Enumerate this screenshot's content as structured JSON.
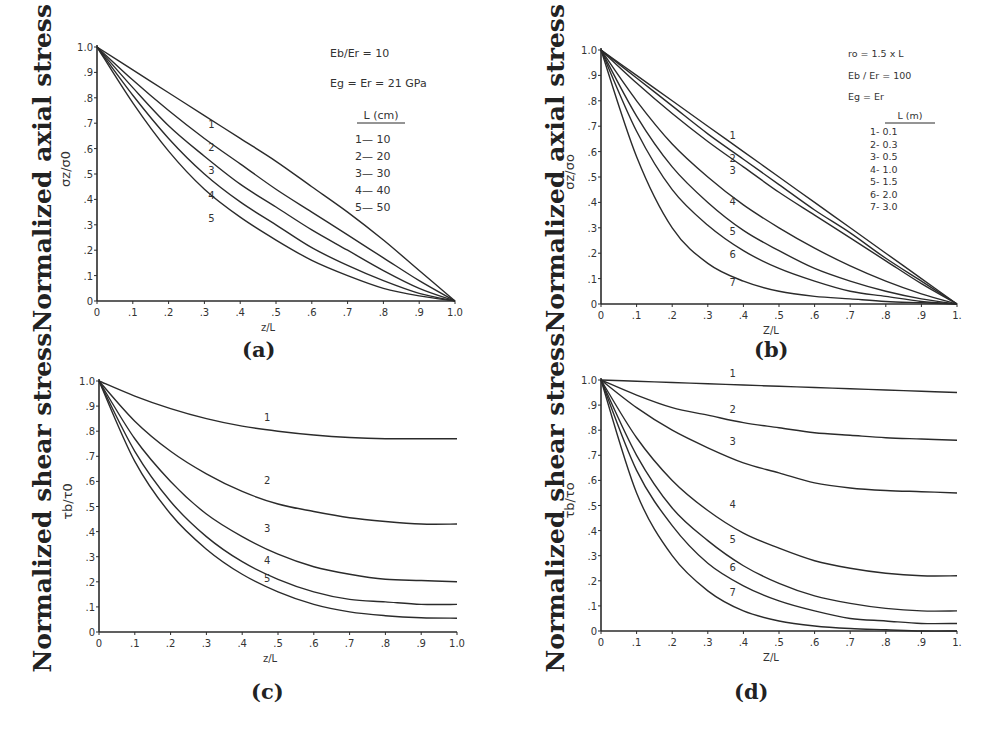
{
  "figure": {
    "panels": [
      {
        "id": "a",
        "label": "(a)",
        "big_ylabel": "Normalized axial stress"
      },
      {
        "id": "b",
        "label": "(b)",
        "big_ylabel": "Normalized axial stress"
      },
      {
        "id": "c",
        "label": "(c)",
        "big_ylabel": "Normalized shear stress"
      },
      {
        "id": "d",
        "label": "(d)",
        "big_ylabel": "Normalized shear stress"
      }
    ]
  },
  "chart_data": [
    {
      "panel": "a",
      "type": "line",
      "title": "",
      "ylabel": "σz/σ0",
      "xlabel": "z/L",
      "xlim": [
        0,
        1.0
      ],
      "ylim": [
        0,
        1.0
      ],
      "xticks": [
        "0",
        ".1",
        ".2",
        ".3",
        ".4",
        ".5",
        ".6",
        ".7",
        ".8",
        ".9",
        "1.0"
      ],
      "yticks": [
        "0",
        ".1",
        ".2",
        ".3",
        ".4",
        ".5",
        ".6",
        ".7",
        ".8",
        ".9",
        "1.0"
      ],
      "grid": false,
      "annotations": [
        "Eb/Er = 10",
        "Eg = Er = 21 GPa"
      ],
      "legend_title": "L (cm)",
      "legend": [
        "1— 10",
        "2— 20",
        "3— 30",
        "4— 40",
        "5— 50"
      ],
      "x": [
        0,
        0.1,
        0.2,
        0.3,
        0.4,
        0.5,
        0.6,
        0.7,
        0.8,
        0.9,
        1.0
      ],
      "series": [
        {
          "name": "1",
          "L": "10 cm",
          "values": [
            1,
            0.91,
            0.82,
            0.73,
            0.64,
            0.55,
            0.45,
            0.35,
            0.24,
            0.12,
            0
          ],
          "label_at": [
            0.32,
            0.68
          ]
        },
        {
          "name": "2",
          "L": "20 cm",
          "values": [
            1,
            0.87,
            0.75,
            0.64,
            0.54,
            0.44,
            0.35,
            0.26,
            0.17,
            0.08,
            0
          ],
          "label_at": [
            0.32,
            0.59
          ]
        },
        {
          "name": "3",
          "L": "30 cm",
          "values": [
            1,
            0.84,
            0.69,
            0.57,
            0.46,
            0.37,
            0.28,
            0.2,
            0.12,
            0.05,
            0
          ],
          "label_at": [
            0.32,
            0.5
          ]
        },
        {
          "name": "4",
          "L": "40 cm",
          "values": [
            1,
            0.81,
            0.64,
            0.5,
            0.39,
            0.3,
            0.21,
            0.14,
            0.08,
            0.03,
            0
          ],
          "label_at": [
            0.32,
            0.4
          ]
        },
        {
          "name": "5",
          "L": "50 cm",
          "values": [
            1,
            0.78,
            0.59,
            0.44,
            0.33,
            0.24,
            0.16,
            0.1,
            0.05,
            0.02,
            0
          ],
          "label_at": [
            0.32,
            0.31
          ]
        }
      ]
    },
    {
      "panel": "b",
      "type": "line",
      "title": "",
      "ylabel": "σz/σo",
      "xlabel": "Z/L",
      "xlim": [
        0,
        1.0
      ],
      "ylim": [
        0,
        1.0
      ],
      "xticks": [
        "0",
        ".1",
        ".2",
        ".3",
        ".4",
        ".5",
        ".6",
        ".7",
        ".8",
        ".9",
        "1."
      ],
      "yticks": [
        "0",
        ".1",
        ".2",
        ".3",
        ".4",
        ".5",
        ".6",
        ".7",
        ".8",
        ".9",
        "1.0"
      ],
      "grid": false,
      "annotations": [
        "ro = 1.5 x L",
        "Eb / Er = 100",
        "Eg = Er"
      ],
      "legend_title": "L (m)",
      "legend": [
        "1- 0.1",
        "2- 0.3",
        "3- 0.5",
        "4- 1.0",
        "5- 1.5",
        "6- 2.0",
        "7- 3.0"
      ],
      "x": [
        0,
        0.1,
        0.2,
        0.3,
        0.4,
        0.5,
        0.6,
        0.7,
        0.8,
        0.9,
        1.0
      ],
      "series": [
        {
          "name": "1",
          "L": "0.1 m",
          "values": [
            1,
            0.9,
            0.8,
            0.7,
            0.6,
            0.5,
            0.4,
            0.3,
            0.2,
            0.1,
            0
          ],
          "label_at": [
            0.37,
            0.65
          ]
        },
        {
          "name": "2",
          "L": "0.3 m",
          "values": [
            1,
            0.89,
            0.78,
            0.67,
            0.57,
            0.47,
            0.37,
            0.28,
            0.18,
            0.09,
            0
          ],
          "label_at": [
            0.37,
            0.56
          ]
        },
        {
          "name": "3",
          "L": "0.5 m",
          "values": [
            1,
            0.87,
            0.75,
            0.64,
            0.54,
            0.44,
            0.35,
            0.26,
            0.17,
            0.08,
            0
          ],
          "label_at": [
            0.37,
            0.51
          ]
        },
        {
          "name": "4",
          "L": "1.0 m",
          "values": [
            1,
            0.8,
            0.63,
            0.5,
            0.39,
            0.3,
            0.22,
            0.15,
            0.09,
            0.04,
            0
          ],
          "label_at": [
            0.37,
            0.39
          ]
        },
        {
          "name": "5",
          "L": "1.5 m",
          "values": [
            1,
            0.74,
            0.54,
            0.4,
            0.29,
            0.21,
            0.14,
            0.09,
            0.05,
            0.02,
            0
          ],
          "label_at": [
            0.37,
            0.27
          ]
        },
        {
          "name": "6",
          "L": "2.0 m",
          "values": [
            1,
            0.68,
            0.45,
            0.31,
            0.21,
            0.14,
            0.09,
            0.05,
            0.03,
            0.01,
            0
          ],
          "label_at": [
            0.37,
            0.18
          ]
        },
        {
          "name": "7",
          "L": "3.0 m",
          "values": [
            1,
            0.58,
            0.3,
            0.16,
            0.09,
            0.05,
            0.03,
            0.02,
            0.01,
            0.005,
            0
          ],
          "label_at": [
            0.37,
            0.07
          ]
        }
      ]
    },
    {
      "panel": "c",
      "type": "line",
      "title": "",
      "ylabel": "τb/τ0",
      "xlabel": "z/L",
      "xlim": [
        0,
        1.0
      ],
      "ylim": [
        0,
        1.0
      ],
      "xticks": [
        "0",
        ".1",
        ".2",
        ".3",
        ".4",
        ".5",
        ".6",
        ".7",
        ".8",
        ".9",
        "1.0"
      ],
      "yticks": [
        "0",
        ".1",
        ".2",
        ".3",
        ".4",
        ".5",
        ".6",
        ".7",
        ".8",
        ".9",
        "1.0"
      ],
      "grid": false,
      "x": [
        0,
        0.1,
        0.2,
        0.3,
        0.4,
        0.5,
        0.6,
        0.7,
        0.8,
        0.9,
        1.0
      ],
      "series": [
        {
          "name": "1",
          "values": [
            1,
            0.94,
            0.89,
            0.85,
            0.82,
            0.8,
            0.785,
            0.775,
            0.77,
            0.77,
            0.77
          ],
          "label_at": [
            0.47,
            0.84
          ]
        },
        {
          "name": "2",
          "values": [
            1,
            0.84,
            0.72,
            0.63,
            0.56,
            0.51,
            0.48,
            0.455,
            0.44,
            0.43,
            0.43
          ],
          "label_at": [
            0.47,
            0.59
          ]
        },
        {
          "name": "3",
          "values": [
            1,
            0.77,
            0.6,
            0.47,
            0.38,
            0.31,
            0.26,
            0.23,
            0.21,
            0.205,
            0.2
          ],
          "label_at": [
            0.47,
            0.4
          ]
        },
        {
          "name": "4",
          "values": [
            1,
            0.72,
            0.52,
            0.38,
            0.28,
            0.21,
            0.16,
            0.13,
            0.12,
            0.11,
            0.11
          ],
          "label_at": [
            0.47,
            0.27
          ]
        },
        {
          "name": "5",
          "values": [
            1,
            0.68,
            0.47,
            0.33,
            0.23,
            0.16,
            0.11,
            0.08,
            0.065,
            0.057,
            0.055
          ],
          "label_at": [
            0.47,
            0.2
          ]
        }
      ]
    },
    {
      "panel": "d",
      "type": "line",
      "title": "",
      "ylabel": "τb/τo",
      "xlabel": "Z/L",
      "xlim": [
        0,
        1.0
      ],
      "ylim": [
        0,
        1.0
      ],
      "xticks": [
        "0",
        ".1",
        ".2",
        ".3",
        ".4",
        ".5",
        ".6",
        ".7",
        ".8",
        ".9",
        "1."
      ],
      "yticks": [
        "0",
        ".1",
        ".2",
        ".3",
        ".4",
        ".5",
        ".6",
        ".7",
        ".8",
        ".9",
        "1.0"
      ],
      "grid": false,
      "x": [
        0,
        0.1,
        0.2,
        0.3,
        0.4,
        0.5,
        0.6,
        0.7,
        0.8,
        0.9,
        1.0
      ],
      "series": [
        {
          "name": "1",
          "values": [
            1,
            0.995,
            0.99,
            0.985,
            0.98,
            0.975,
            0.97,
            0.965,
            0.96,
            0.955,
            0.95
          ],
          "label_at": [
            0.37,
            1.01
          ]
        },
        {
          "name": "2",
          "values": [
            1,
            0.94,
            0.89,
            0.86,
            0.83,
            0.81,
            0.79,
            0.78,
            0.77,
            0.765,
            0.76
          ],
          "label_at": [
            0.37,
            0.87
          ]
        },
        {
          "name": "3",
          "values": [
            1,
            0.89,
            0.8,
            0.73,
            0.67,
            0.63,
            0.59,
            0.57,
            0.56,
            0.555,
            0.55
          ],
          "label_at": [
            0.37,
            0.74
          ]
        },
        {
          "name": "4",
          "values": [
            1,
            0.77,
            0.6,
            0.48,
            0.39,
            0.33,
            0.28,
            0.25,
            0.23,
            0.22,
            0.22
          ],
          "label_at": [
            0.37,
            0.49
          ]
        },
        {
          "name": "5",
          "values": [
            1,
            0.7,
            0.49,
            0.36,
            0.26,
            0.19,
            0.14,
            0.11,
            0.09,
            0.08,
            0.08
          ],
          "label_at": [
            0.37,
            0.35
          ]
        },
        {
          "name": "6",
          "values": [
            1,
            0.64,
            0.42,
            0.27,
            0.18,
            0.12,
            0.08,
            0.05,
            0.04,
            0.03,
            0.03
          ],
          "label_at": [
            0.37,
            0.24
          ]
        },
        {
          "name": "7",
          "values": [
            1,
            0.55,
            0.3,
            0.16,
            0.08,
            0.04,
            0.02,
            0.01,
            0.005,
            0,
            0
          ],
          "label_at": [
            0.37,
            0.14
          ]
        }
      ]
    }
  ],
  "layout": {
    "ink_color": "#2b2b2b",
    "axes": [
      {
        "panel": "a",
        "x0": 97,
        "x1": 455,
        "y0": 301,
        "y1": 47
      },
      {
        "panel": "b",
        "x0": 601,
        "x1": 957,
        "y0": 304,
        "y1": 50
      },
      {
        "panel": "c",
        "x0": 99,
        "x1": 457,
        "y0": 632,
        "y1": 381
      },
      {
        "panel": "d",
        "x0": 601,
        "x1": 957,
        "y0": 631,
        "y1": 380
      }
    ]
  }
}
